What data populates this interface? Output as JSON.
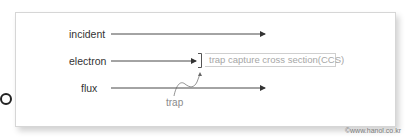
{
  "diagram": {
    "rows": [
      {
        "label": "incident"
      },
      {
        "label": "electron"
      },
      {
        "label": "flux"
      }
    ],
    "ccs_label": "trap capture cross section(CCS)",
    "trap_label": "trap",
    "credit": "©www.hanol.co.kr"
  },
  "colors": {
    "line": "#333333",
    "muted_text": "#a6a6a6",
    "border": "#d6d6d6"
  }
}
